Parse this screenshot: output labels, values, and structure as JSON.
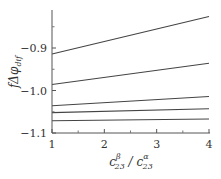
{
  "chart_data": {
    "type": "line",
    "title": "",
    "xlabel": "c_23^β / c_23^α",
    "xlabel_parts": {
      "base1": "c",
      "sup1": "β",
      "sub1": "23",
      "sep": " / ",
      "base2": "c",
      "sup2": "α",
      "sub2": "23"
    },
    "ylabel": "fΔφ_dif",
    "ylabel_parts": {
      "prefix": "fΔφ",
      "sub": "dif"
    },
    "xlim": [
      1,
      4
    ],
    "ylim": [
      -1.1,
      -0.81
    ],
    "xticks": [
      1,
      2,
      3,
      4
    ],
    "xtick_labels": [
      "1",
      "2",
      "3",
      "4"
    ],
    "xminor": [
      1.5,
      2.5,
      3.5
    ],
    "yticks": [
      -0.9,
      -1.0,
      -1.1
    ],
    "ytick_labels": [
      "−0.9",
      "−1.0",
      "−1.1"
    ],
    "yminor": [
      -0.85,
      -0.95,
      -1.05
    ],
    "grid": false,
    "legend": null,
    "x": [
      1,
      4
    ],
    "series": [
      {
        "name": "line1",
        "values": [
          -0.914,
          -0.826
        ]
      },
      {
        "name": "line2",
        "values": [
          -0.986,
          -0.936
        ]
      },
      {
        "name": "line3",
        "values": [
          -1.036,
          -1.014
        ]
      },
      {
        "name": "line4",
        "values": [
          -1.052,
          -1.043
        ]
      },
      {
        "name": "line5",
        "values": [
          -1.071,
          -1.067
        ]
      }
    ],
    "line_color": "#444444"
  }
}
